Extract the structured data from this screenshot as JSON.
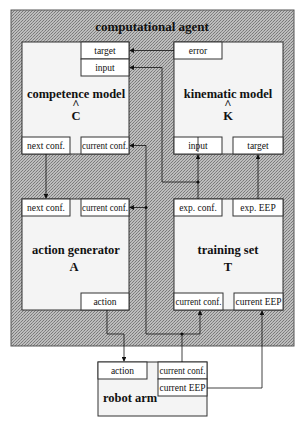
{
  "agent": {
    "title": "computational agent"
  },
  "modules": {
    "competence": {
      "name": "competence model",
      "symbol": "C",
      "hat": "^",
      "ports": {
        "target": "target",
        "input": "input",
        "next_conf": "next conf.",
        "current_conf": "current conf."
      }
    },
    "kinematic": {
      "name": "kinematic model",
      "symbol": "K",
      "hat": "^",
      "ports": {
        "error": "error",
        "input": "input",
        "target": "target"
      }
    },
    "action_generator": {
      "name": "action generator",
      "symbol": "A",
      "ports": {
        "next_conf": "next conf.",
        "current_conf": "current conf.",
        "action": "action"
      }
    },
    "training_set": {
      "name": "training set",
      "symbol": "T",
      "ports": {
        "exp_conf": "exp. conf.",
        "exp_eep": "exp. EEP",
        "current_conf": "current conf.",
        "current_eep": "current EEP"
      }
    },
    "robot_arm": {
      "name": "robot arm",
      "ports": {
        "action": "action",
        "current_conf": "current conf.",
        "current_eep": "current EEP"
      }
    }
  },
  "colors": {
    "agent_bg": "#a8a8a8",
    "module_bg": "#f4f4f4",
    "line": "#222222"
  }
}
